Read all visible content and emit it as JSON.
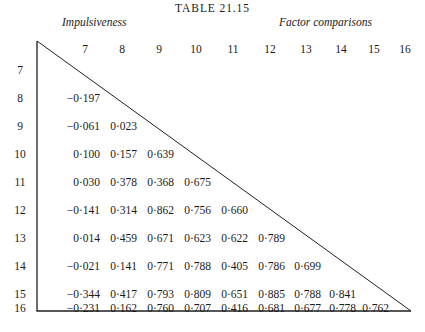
{
  "title": "TABLE 21.15",
  "captions": {
    "rows": "Impulsiveness",
    "columns": "Factor comparisons"
  },
  "column_headers": [
    "7",
    "8",
    "9",
    "10",
    "11",
    "12",
    "13",
    "14",
    "15",
    "16"
  ],
  "row_headers": [
    "7",
    "8",
    "9",
    "10",
    "11",
    "12",
    "13",
    "14",
    "15",
    "16"
  ],
  "chart_data": {
    "type": "table",
    "title": "TABLE 21.15",
    "xlabel": "Factor comparisons",
    "ylabel": "Impulsiveness",
    "shape": "lower-triangular correlation matrix",
    "decimal_separator": "·",
    "categories": [
      "7",
      "8",
      "9",
      "10",
      "11",
      "12",
      "13",
      "14",
      "15",
      "16"
    ],
    "rows": [
      {
        "label": "7",
        "values": []
      },
      {
        "label": "8",
        "values": [
          "−0·197"
        ]
      },
      {
        "label": "9",
        "values": [
          "−0·061",
          "0·023"
        ]
      },
      {
        "label": "10",
        "values": [
          "0·100",
          "0·157",
          "0·639"
        ]
      },
      {
        "label": "11",
        "values": [
          "0·030",
          "0·378",
          "0·368",
          "0·675"
        ]
      },
      {
        "label": "12",
        "values": [
          "−0·141",
          "0·314",
          "0·862",
          "0·756",
          "0·660"
        ]
      },
      {
        "label": "13",
        "values": [
          "0·014",
          "0·459",
          "0·671",
          "0·623",
          "0·622",
          "0·789"
        ]
      },
      {
        "label": "14",
        "values": [
          "−0·021",
          "0·141",
          "0·771",
          "0·788",
          "0·405",
          "0·786",
          "0·699"
        ]
      },
      {
        "label": "15",
        "values": [
          "−0·344",
          "0·417",
          "0·793",
          "0·809",
          "0·651",
          "0·885",
          "0·788",
          "0·841"
        ]
      },
      {
        "label": "16",
        "values": [
          "−0·231",
          "0·162",
          "0·760",
          "0·707",
          "0·416",
          "0·681",
          "0·677",
          "0·778",
          "0·762"
        ]
      }
    ],
    "numeric_rows": [
      {
        "label": "7",
        "values": []
      },
      {
        "label": "8",
        "values": [
          -0.197
        ]
      },
      {
        "label": "9",
        "values": [
          -0.061,
          0.023
        ]
      },
      {
        "label": "10",
        "values": [
          0.1,
          0.157,
          0.639
        ]
      },
      {
        "label": "11",
        "values": [
          0.03,
          0.378,
          0.368,
          0.675
        ]
      },
      {
        "label": "12",
        "values": [
          -0.141,
          0.314,
          0.862,
          0.756,
          0.66
        ]
      },
      {
        "label": "13",
        "values": [
          0.014,
          0.459,
          0.671,
          0.623,
          0.622,
          0.789
        ]
      },
      {
        "label": "14",
        "values": [
          -0.021,
          0.141,
          0.771,
          0.788,
          0.405,
          0.786,
          0.699
        ]
      },
      {
        "label": "15",
        "values": [
          -0.344,
          0.417,
          0.793,
          0.809,
          0.651,
          0.885,
          0.788,
          0.841
        ]
      },
      {
        "label": "16",
        "values": [
          -0.231,
          0.162,
          0.76,
          0.707,
          0.416,
          0.681,
          0.677,
          0.778,
          0.762
        ]
      }
    ],
    "grid": false,
    "legend": "none"
  },
  "colors": {
    "ink": "#1a1a1a",
    "rule": "#1f1f1f",
    "background": "#ffffff"
  },
  "geometry": {
    "col_x": [
      85,
      122,
      159,
      196,
      233,
      270,
      306,
      341,
      374,
      405
    ],
    "row_y": [
      72,
      100,
      128,
      156,
      184,
      212,
      240,
      268,
      296,
      310
    ],
    "vertical_rule_x": 37,
    "top_y": 41,
    "bottom_y": 311,
    "apex_x": 411
  }
}
